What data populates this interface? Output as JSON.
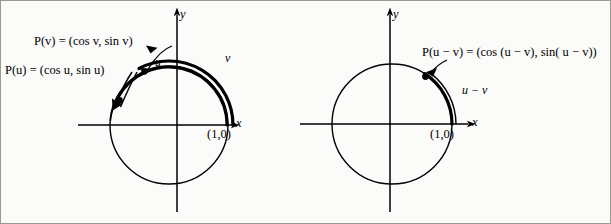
{
  "figure": {
    "background_color": "#fbfbf9",
    "stroke_color": "#000000",
    "border_color": "#9a9a92"
  },
  "left_diagram": {
    "name": "unit-circle-u-and-v",
    "axis_x_label": "x",
    "axis_y_label": "y",
    "origin_point_label": "(1,0)",
    "point_v_label": "P(v) = (cos v, sin v)",
    "point_u_label": "P(u) = (cos u, sin u)",
    "arc_v_label": "v",
    "arc_u_label": "u",
    "circle": {
      "cx": 169,
      "cy": 125,
      "r": 59
    },
    "arc_u_angle_deg": 152,
    "arc_v_angle_deg": 118
  },
  "right_diagram": {
    "name": "unit-circle-u-minus-v",
    "axis_x_label": "x",
    "axis_y_label": "y",
    "origin_point_label": "(1,0)",
    "point_label": "P(u − v) = (cos (u − v), sin( u − v))",
    "arc_label": "u − v",
    "circle": {
      "cx": 392,
      "cy": 124,
      "r": 60
    },
    "arc_angle_deg": 57
  }
}
